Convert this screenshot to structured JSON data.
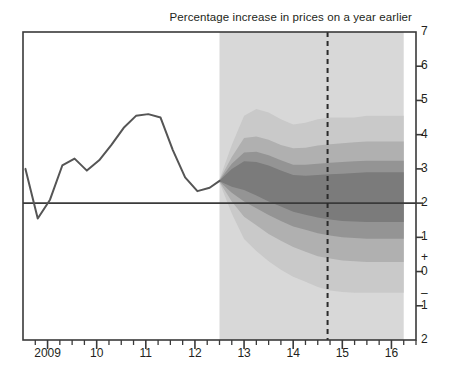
{
  "chart_data": {
    "type": "area",
    "title": "Percentage increase in prices on a year earlier",
    "xlabel": "",
    "ylabel": "",
    "ylim": [
      -2,
      7
    ],
    "xlim": [
      2008.5,
      2016.5
    ],
    "grid": false,
    "legend": null,
    "y_ticks": [
      {
        "value": 7,
        "label": "7"
      },
      {
        "value": 6,
        "label": "6"
      },
      {
        "value": 5,
        "label": "5"
      },
      {
        "value": 4,
        "label": "4"
      },
      {
        "value": 3,
        "label": "3"
      },
      {
        "value": 2,
        "label": "2"
      },
      {
        "value": 1,
        "label": "1"
      },
      {
        "value": 0,
        "label": "0"
      },
      {
        "value": -1,
        "label": "1"
      },
      {
        "value": -2,
        "label": "2"
      }
    ],
    "y_sign_plus": "+",
    "y_sign_minus": "–",
    "x_ticks": [
      {
        "value": 2009,
        "label": "2009"
      },
      {
        "value": 2010,
        "label": "10"
      },
      {
        "value": 2011,
        "label": "11"
      },
      {
        "value": 2012,
        "label": "12"
      },
      {
        "value": 2013,
        "label": "13"
      },
      {
        "value": 2014,
        "label": "14"
      },
      {
        "value": 2015,
        "label": "15"
      },
      {
        "value": 2016,
        "label": "16"
      }
    ],
    "target_line": {
      "value": 2.0,
      "label": "2% inflation target"
    },
    "forecast_start": 2012.5,
    "forecast_end": 2016.25,
    "vertical_marker": {
      "value": 2014.7,
      "style": "dashed"
    },
    "history": {
      "name": "CPI inflation",
      "x": [
        2008.55,
        2008.8,
        2009.05,
        2009.3,
        2009.55,
        2009.8,
        2010.05,
        2010.3,
        2010.55,
        2010.8,
        2011.05,
        2011.3,
        2011.55,
        2011.8,
        2012.05,
        2012.3,
        2012.5
      ],
      "y": [
        3.0,
        1.55,
        2.1,
        3.1,
        3.3,
        2.95,
        3.25,
        3.7,
        4.2,
        4.55,
        4.6,
        4.5,
        3.55,
        2.75,
        2.35,
        2.45,
        2.65
      ]
    },
    "fan_bands": [
      {
        "name": "outer-90",
        "color": "#c9c9c9",
        "x": [
          2012.5,
          2012.75,
          2013.0,
          2013.25,
          2013.5,
          2013.75,
          2014.0,
          2014.25,
          2014.5,
          2014.75,
          2015.0,
          2015.25,
          2015.5,
          2015.75,
          2016.0,
          2016.25
        ],
        "upper": [
          2.7,
          3.7,
          4.55,
          4.75,
          4.65,
          4.45,
          4.3,
          4.35,
          4.45,
          4.5,
          4.5,
          4.5,
          4.55,
          4.55,
          4.55,
          4.55
        ],
        "lower": [
          2.6,
          1.7,
          0.95,
          0.6,
          0.3,
          0.05,
          -0.15,
          -0.3,
          -0.45,
          -0.55,
          -0.6,
          -0.62,
          -0.62,
          -0.62,
          -0.62,
          -0.62
        ]
      },
      {
        "name": "band-70",
        "color": "#b0b0b0",
        "x": [
          2012.5,
          2012.75,
          2013.0,
          2013.25,
          2013.5,
          2013.75,
          2014.0,
          2014.25,
          2014.5,
          2014.75,
          2015.0,
          2015.25,
          2015.5,
          2015.75,
          2016.0,
          2016.25
        ],
        "upper": [
          2.68,
          3.35,
          3.9,
          3.95,
          3.85,
          3.7,
          3.6,
          3.62,
          3.68,
          3.72,
          3.75,
          3.78,
          3.8,
          3.8,
          3.8,
          3.8
        ],
        "lower": [
          2.62,
          2.05,
          1.6,
          1.35,
          1.1,
          0.9,
          0.72,
          0.58,
          0.45,
          0.38,
          0.32,
          0.3,
          0.28,
          0.28,
          0.28,
          0.28
        ]
      },
      {
        "name": "band-50",
        "color": "#949494",
        "x": [
          2012.5,
          2012.75,
          2013.0,
          2013.25,
          2013.5,
          2013.75,
          2014.0,
          2014.25,
          2014.5,
          2014.75,
          2015.0,
          2015.25,
          2015.5,
          2015.75,
          2016.0,
          2016.25
        ],
        "upper": [
          2.67,
          3.15,
          3.48,
          3.5,
          3.4,
          3.25,
          3.12,
          3.12,
          3.15,
          3.18,
          3.2,
          3.22,
          3.24,
          3.24,
          3.24,
          3.24
        ],
        "lower": [
          2.63,
          2.3,
          2.05,
          1.85,
          1.65,
          1.48,
          1.32,
          1.22,
          1.12,
          1.05,
          1.0,
          0.98,
          0.96,
          0.96,
          0.96,
          0.96
        ]
      },
      {
        "name": "band-30-central",
        "color": "#7b7b7b",
        "x": [
          2012.5,
          2012.75,
          2013.0,
          2013.25,
          2013.5,
          2013.75,
          2014.0,
          2014.25,
          2014.5,
          2014.75,
          2015.0,
          2015.25,
          2015.5,
          2015.75,
          2016.0,
          2016.25
        ],
        "upper": [
          2.66,
          3.0,
          3.22,
          3.2,
          3.1,
          2.95,
          2.82,
          2.8,
          2.82,
          2.84,
          2.86,
          2.88,
          2.9,
          2.9,
          2.9,
          2.9
        ],
        "lower": [
          2.64,
          2.48,
          2.38,
          2.22,
          2.05,
          1.9,
          1.75,
          1.66,
          1.58,
          1.52,
          1.48,
          1.46,
          1.45,
          1.45,
          1.45,
          1.45
        ]
      }
    ],
    "forecast_backdrop_color": "#d8d8d8",
    "frame_color": "#3a3a3a",
    "line_color": "#555555"
  }
}
